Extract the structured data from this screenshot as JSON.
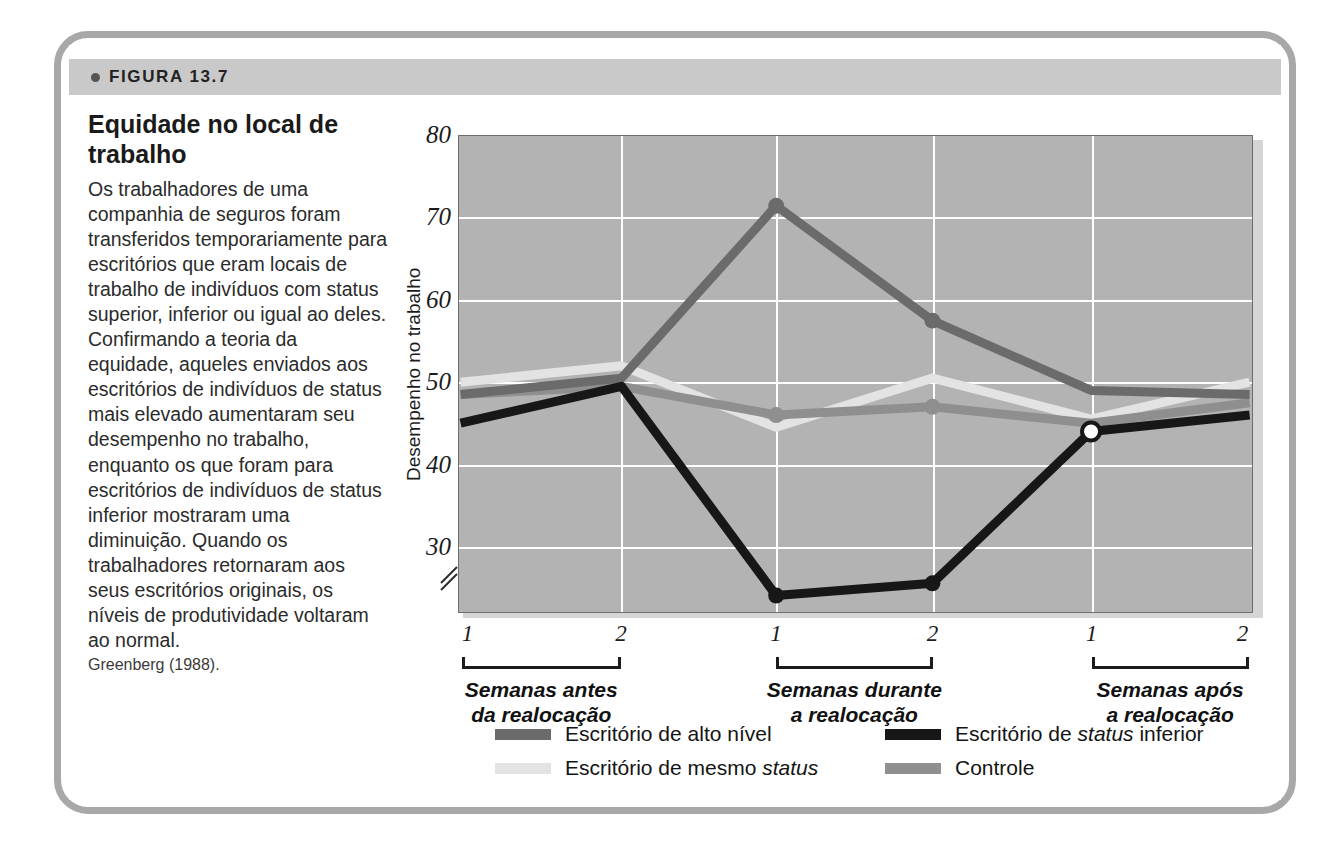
{
  "figure": {
    "bullet_icon": "bullet-dot-icon",
    "label": "FIGURA 13.7",
    "title": "Equidade no local de trabalho",
    "body": "Os trabalhadores de uma companhia de seguros foram transferidos temporariamente para escritórios que eram locais de trabalho de indivíduos com status superior, inferior ou igual ao deles. Confirmando a teoria da equidade, aqueles enviados aos escritórios de indivíduos de status mais elevado aumentaram seu desempenho no trabalho, enquanto os que foram para escritórios de indivíduos de status inferior mostraram uma diminuição. Quando os trabalhadores retornaram aos seus escritórios originais, os níveis de produtividade voltaram ao normal.",
    "source": "Greenberg (1988)."
  },
  "chart_data": {
    "type": "line",
    "title": "Equidade no local de trabalho",
    "xlabel": "",
    "ylabel": "Desempenho no trabalho",
    "ylim": [
      22,
      80
    ],
    "yticks": [
      30,
      40,
      50,
      60,
      70,
      80
    ],
    "ytick_labels": [
      "30",
      "40",
      "50",
      "60",
      "70",
      "80"
    ],
    "y_axis_break": true,
    "grid": true,
    "grid_color": "#ffffff",
    "plot_background": "#b3b3b3",
    "legend_position": "bottom",
    "x_tick_labels": [
      "1",
      "2",
      "1",
      "2",
      "1",
      "2"
    ],
    "x_groups": [
      {
        "label_line1": "Semanas antes",
        "label_line2": "da realocação",
        "ticks": [
          "1",
          "2"
        ]
      },
      {
        "label_line1": "Semanas durante",
        "label_line2": "a realocação",
        "ticks": [
          "1",
          "2"
        ]
      },
      {
        "label_line1": "Semanas após",
        "label_line2": "a realocação",
        "ticks": [
          "1",
          "2"
        ]
      }
    ],
    "x": [
      1,
      2,
      3,
      4,
      5,
      6
    ],
    "series": [
      {
        "name": "Escritório de alto nível",
        "color": "#6b6b6b",
        "values": [
          48.5,
          50.5,
          71.5,
          57.5,
          49,
          48.5
        ]
      },
      {
        "name": "Escritório de status inferior",
        "color": "#171717",
        "values": [
          45,
          49.5,
          24,
          25.5,
          44,
          46
        ]
      },
      {
        "name": "Escritório de mesmo status",
        "color": "#e3e3e3",
        "values": [
          50,
          52,
          44.5,
          50.5,
          45.5,
          50
        ]
      },
      {
        "name": "Controle",
        "color": "#8f8f8f",
        "values": [
          48.5,
          49.5,
          46,
          47,
          45,
          47.5
        ]
      }
    ],
    "markers": [
      {
        "series": "Escritório de alto nível",
        "x": 3,
        "y": 71.5,
        "style": "filled"
      },
      {
        "series": "Escritório de alto nível",
        "x": 4,
        "y": 57.5,
        "style": "filled"
      },
      {
        "series": "Escritório de status inferior",
        "x": 3,
        "y": 24,
        "style": "filled"
      },
      {
        "series": "Escritório de status inferior",
        "x": 4,
        "y": 25.5,
        "style": "filled"
      },
      {
        "series": "Controle",
        "x": 3,
        "y": 46,
        "style": "filled"
      },
      {
        "series": "Controle",
        "x": 4,
        "y": 47,
        "style": "filled"
      },
      {
        "series": "Escritório de status inferior",
        "x": 5,
        "y": 44,
        "style": "open"
      }
    ],
    "legend": [
      {
        "label": "Escritório de alto nível",
        "color": "#6b6b6b",
        "italic_word": ""
      },
      {
        "label": "Escritório de status inferior",
        "color": "#171717",
        "italic_word": "status"
      },
      {
        "label": "Escritório de mesmo status",
        "color": "#e3e3e3",
        "italic_word": "status"
      },
      {
        "label": "Controle",
        "color": "#8f8f8f",
        "italic_word": ""
      }
    ]
  },
  "axis": {
    "y_title": "Desempenho no trabalho",
    "y_labels": [
      "80",
      "70",
      "60",
      "50",
      "40",
      "30"
    ],
    "break_symbol": "⁄⁄"
  }
}
